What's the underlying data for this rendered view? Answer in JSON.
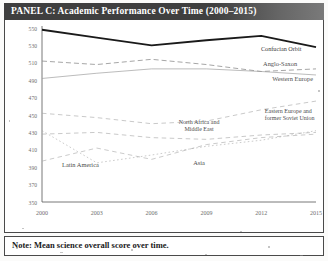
{
  "panel": {
    "title": "PANEL C: Academic Performance Over Time (2000–2015)",
    "note": "Note: Mean science overall score over time."
  },
  "chart_data": {
    "type": "line",
    "title": "PANEL C: Academic Performance Over Time (2000–2015)",
    "xlabel": "",
    "ylabel": "",
    "x": [
      2000,
      2003,
      2006,
      2009,
      2012,
      2015
    ],
    "xticklabels": [
      "2000",
      "2003",
      "2006",
      "2009",
      "2012",
      "2015"
    ],
    "yticks": [
      350,
      370,
      390,
      410,
      430,
      450,
      470,
      490,
      510,
      530,
      550
    ],
    "yticklabels": [
      "350",
      "370",
      "390",
      "410",
      "430",
      "450",
      "470",
      "490",
      "510",
      "530",
      "550"
    ],
    "ylim": [
      350,
      550
    ],
    "xlim": [
      2000,
      2015
    ],
    "grid": false,
    "legend": "inline-labels",
    "series": [
      {
        "name": "Confucian Orbit",
        "style": "solid-bold",
        "color": "#1a1a1a",
        "values": [
          548,
          539,
          530,
          536,
          541,
          528
        ],
        "label_x": 2014.2,
        "label_y": 524,
        "label_anchor": "end"
      },
      {
        "name": "Anglo-Saxon",
        "style": "dashed",
        "color": "#8a8a8a",
        "values": [
          512,
          508,
          514,
          508,
          500,
          503
        ],
        "label_x": 2012.1,
        "label_y": 506,
        "label_anchor": "start"
      },
      {
        "name": "Western Europe",
        "style": "solid-light",
        "color": "#9c9c9c",
        "values": [
          492,
          498,
          503,
          503,
          500,
          496
        ],
        "label_x": 2012.6,
        "label_y": 489,
        "label_anchor": "start"
      },
      {
        "name": "Eastern Europe and former Soviet Union",
        "style": "dashed-light",
        "color": "#a5a5a5",
        "values": [
          452,
          447,
          440,
          443,
          456,
          466
        ],
        "label_line_1": "Eastern Europe and",
        "label_line_2": "former Soviet Union",
        "label_x": 2012.2,
        "label_y": 452,
        "label_anchor": "start"
      },
      {
        "name": "North Africa and Middle East",
        "style": "dashed-light",
        "color": "#a5a5a5",
        "values": [
          428,
          430,
          424,
          422,
          427,
          430
        ],
        "label_line_1": "North Africa and",
        "label_line_2": "Middle East",
        "label_x": 2008.6,
        "label_y": 440,
        "label_anchor": "middle"
      },
      {
        "name": "Latin America",
        "style": "dashed-light",
        "color": "#a8a8a8",
        "values": [
          397,
          412,
          399,
          416,
          424,
          428
        ],
        "label_x": 2001.1,
        "label_y": 390,
        "label_anchor": "start"
      },
      {
        "name": "Asia",
        "style": "dotted",
        "color": "#a8a8a8",
        "values": [
          432,
          395,
          404,
          414,
          421,
          432
        ],
        "label_x": 2008.6,
        "label_y": 392,
        "label_anchor": "middle"
      }
    ]
  }
}
